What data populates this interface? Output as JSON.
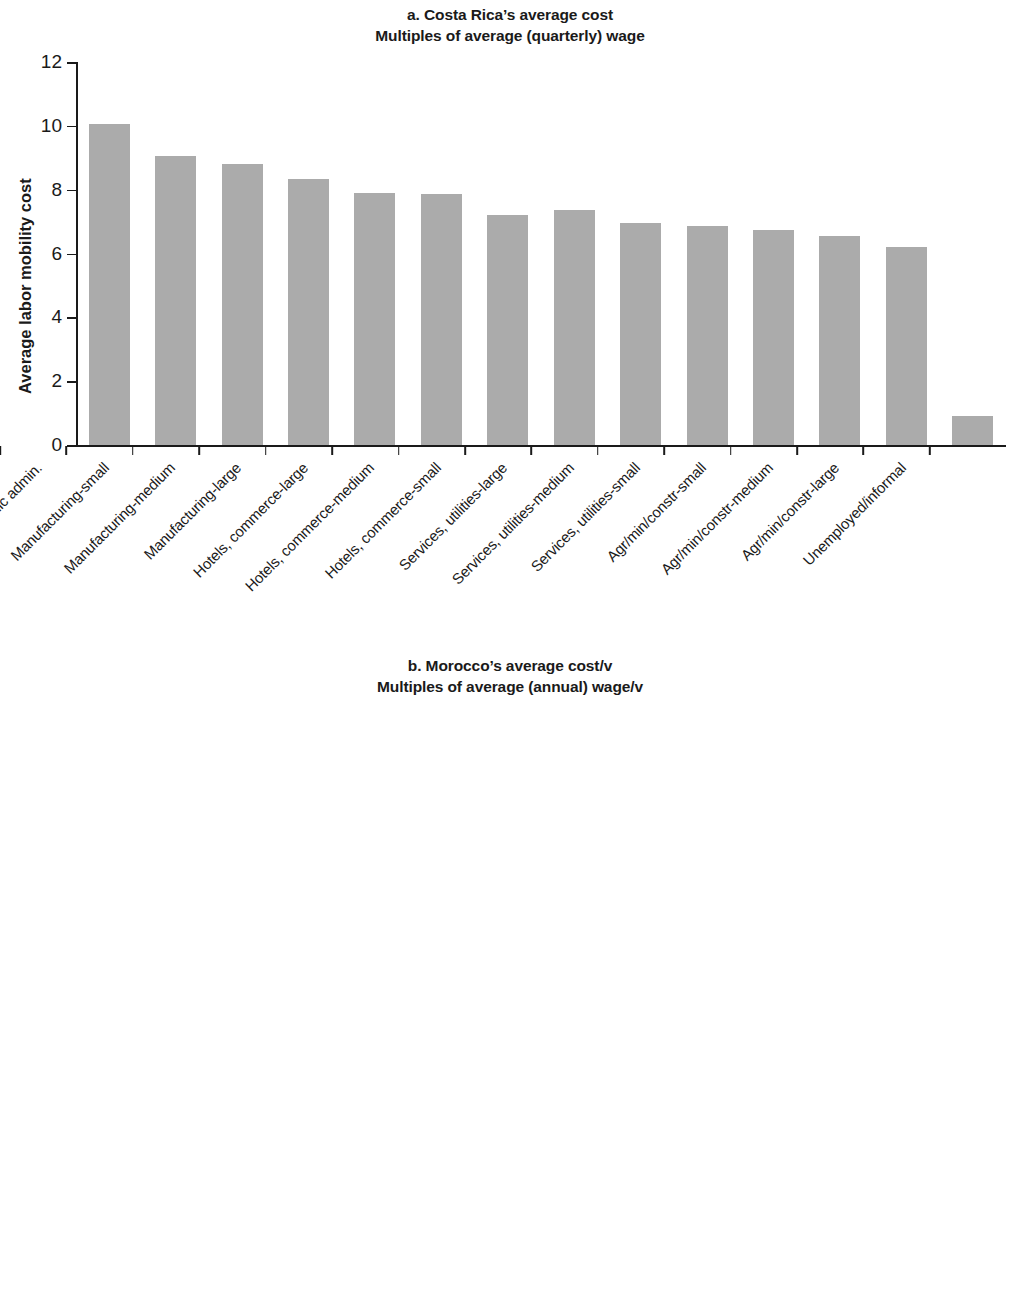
{
  "figure": {
    "bar_color": "#ababab",
    "axis_color": "#1a1a1a"
  },
  "panel_a": {
    "title_line1": "a. Costa Rica’s average cost",
    "title_line2": "Multiples of average (quarterly) wage",
    "ylabel": "Average labor mobility cost",
    "yticks": [
      "0",
      "2",
      "4",
      "6",
      "8",
      "10",
      "12"
    ]
  },
  "panel_b": {
    "title_line1": "b. Morocco’s average cost/v",
    "title_line2": "Multiples of average (annual) wage/v",
    "ylabel": "Average labor mobility cost/v",
    "yticks": [
      "0",
      "2",
      "4",
      "6",
      "8",
      "10",
      "12"
    ]
  },
  "chart_data": [
    {
      "type": "bar",
      "id": "panel_a",
      "title": "a. Costa Rica’s average cost — Multiples of average (quarterly) wage",
      "xlabel": "",
      "ylabel": "Average labor mobility cost",
      "ylim": [
        0,
        12
      ],
      "ytick_values": [
        0,
        2,
        4,
        6,
        8,
        10,
        12
      ],
      "grid": false,
      "legend": false,
      "categories": [
        "Public admin.",
        "Manufacturing-small",
        "Manufacturing-medium",
        "Manufacturing-large",
        "Hotels, commerce-large",
        "Hotels, commerce-medium",
        "Hotels, commerce-small",
        "Services, utilities-large",
        "Services, utilities-medium",
        "Services, utilities-small",
        "Agr/min/constr-small",
        "Agr/min/constr-medium",
        "Agr/min/constr-large",
        "Unemployed/informal"
      ],
      "values": [
        10.05,
        9.05,
        8.8,
        8.35,
        7.9,
        7.85,
        7.2,
        7.35,
        6.95,
        6.85,
        6.75,
        6.55,
        6.2,
        0.9
      ]
    },
    {
      "type": "bar",
      "id": "panel_b",
      "title": "b. Morocco’s average cost/v — Multiples of average (annual) wage/v",
      "xlabel": "",
      "ylabel": "Average labor mobility cost/v",
      "ylim": [
        0,
        12
      ],
      "ytick_values": [
        0,
        2,
        4,
        6,
        8,
        10,
        12
      ],
      "grid": false,
      "legend": false,
      "categories": [
        "Public admin.",
        "Hotels, commerce-small",
        "Manufacturing-small",
        "Hotels, commerce-medium",
        "Services, utilities-small",
        "Services, utilities-medium",
        "Agr/min/constr-small",
        "Hotels, commerce-large",
        "Manufacturing-medium",
        "Agr/min/constr-medium",
        "Manufacturing-large",
        "Services, utilities-large",
        "Agr/min/constr-large",
        "Unemployed/informal"
      ],
      "values": [
        9.9,
        5.55,
        5.45,
        5.25,
        5.1,
        4.85,
        4.75,
        4.65,
        4.6,
        4.25,
        4.15,
        3.6,
        3.55,
        0.06
      ]
    }
  ]
}
